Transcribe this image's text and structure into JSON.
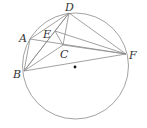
{
  "diagram": {
    "type": "geometry",
    "circle": {
      "cx": 75.5,
      "cy": 66,
      "r": 53
    },
    "center_dot": {
      "x": 75,
      "y": 67
    },
    "points": {
      "A": {
        "x": 30,
        "y": 39,
        "label": "A",
        "lx": 19,
        "ly": 42
      },
      "B": {
        "x": 24,
        "y": 71,
        "label": "B",
        "lx": 13,
        "ly": 78
      },
      "C": {
        "x": 63,
        "y": 45,
        "label": "C",
        "lx": 60,
        "ly": 58
      },
      "D": {
        "x": 69,
        "y": 13,
        "label": "D",
        "lx": 65,
        "ly": 11
      },
      "E": {
        "x": 55,
        "y": 31,
        "label": "E",
        "lx": 43,
        "ly": 38
      },
      "F": {
        "x": 126,
        "y": 54,
        "label": "F",
        "lx": 129,
        "ly": 59
      }
    },
    "segments": [
      [
        "A",
        "B"
      ],
      [
        "A",
        "D"
      ],
      [
        "A",
        "F"
      ],
      [
        "B",
        "D"
      ],
      [
        "B",
        "E"
      ],
      [
        "B",
        "C"
      ],
      [
        "B",
        "F"
      ],
      [
        "D",
        "C"
      ],
      [
        "D",
        "F"
      ],
      [
        "E",
        "C"
      ],
      [
        "E",
        "F"
      ],
      [
        "C",
        "F"
      ],
      [
        "E",
        "D"
      ]
    ]
  }
}
